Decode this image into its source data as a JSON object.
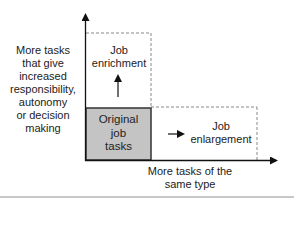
{
  "diagram": {
    "y_axis_label_lines": [
      "More tasks",
      "that give",
      "increased",
      "responsibility,",
      "autonomy",
      "or decision",
      "making"
    ],
    "x_axis_label_lines": [
      "More tasks of the",
      "same type"
    ],
    "boxes": {
      "original": {
        "lines": [
          "Original",
          "job",
          "tasks"
        ],
        "fill": "#c4c4c4",
        "border": "#333333"
      },
      "enrichment": {
        "lines": [
          "Job",
          "enrichment"
        ],
        "style": "dashed"
      },
      "enlargement": {
        "lines": [
          "Job",
          "enlargement"
        ],
        "style": "dashed"
      }
    },
    "colors": {
      "axis": "#111111",
      "dashed": "#888888",
      "rule": "#c8c8c8"
    }
  }
}
